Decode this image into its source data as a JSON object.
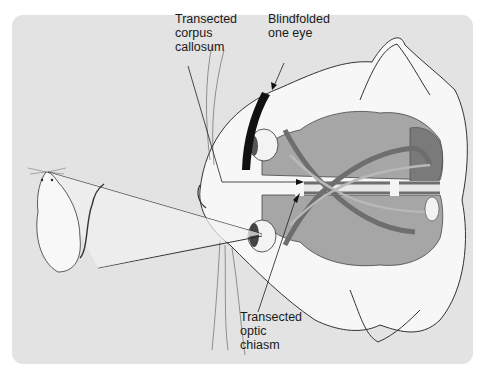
{
  "figure": {
    "type": "split-brain experiment diagram",
    "subjects": [
      "rat (visual stimulus)",
      "cat head with brain cutaway"
    ],
    "labels": {
      "corpus_callosum": [
        "Transected",
        "corpus",
        "callosum"
      ],
      "blindfold": [
        "Blindfolded",
        "one eye"
      ],
      "optic_chiasm": [
        "Transected",
        "optic",
        "chiasm"
      ]
    },
    "colors": {
      "panel_bg": "#e3e3e3",
      "brain_light": "#a6a6a6",
      "brain_dark": "#7a7a7a",
      "tract": "#6e6e6e",
      "blindfold": "#111111",
      "fur": "#f7f7f7"
    }
  }
}
